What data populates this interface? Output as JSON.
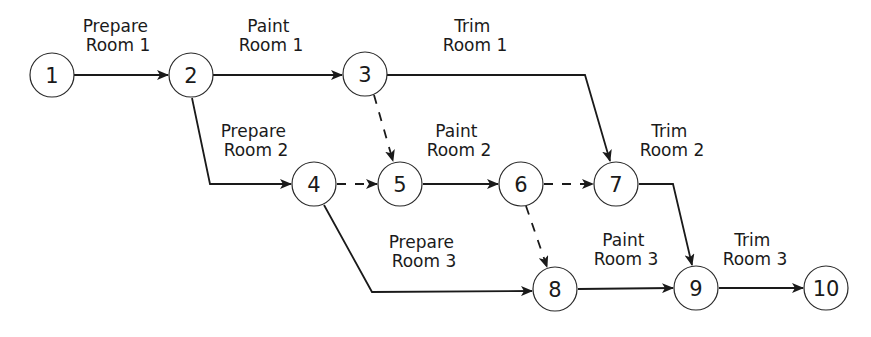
{
  "diagram": {
    "type": "activity-on-arrow network",
    "nodes": [
      {
        "id": "1",
        "label": "1",
        "x": 52,
        "y": 75
      },
      {
        "id": "2",
        "label": "2",
        "x": 191,
        "y": 75
      },
      {
        "id": "3",
        "label": "3",
        "x": 365,
        "y": 74
      },
      {
        "id": "4",
        "label": "4",
        "x": 314,
        "y": 184
      },
      {
        "id": "5",
        "label": "5",
        "x": 400,
        "y": 184
      },
      {
        "id": "6",
        "label": "6",
        "x": 521,
        "y": 184
      },
      {
        "id": "7",
        "label": "7",
        "x": 616,
        "y": 184
      },
      {
        "id": "8",
        "label": "8",
        "x": 555,
        "y": 289
      },
      {
        "id": "9",
        "label": "9",
        "x": 696,
        "y": 288
      },
      {
        "id": "10",
        "label": "10",
        "x": 826,
        "y": 288
      }
    ],
    "edges": [
      {
        "from": "1",
        "to": "2",
        "style": "solid",
        "label_line1": "Prepare",
        "label_line2": "Room 1"
      },
      {
        "from": "2",
        "to": "3",
        "style": "solid",
        "label_line1": "Paint",
        "label_line2": "Room 1"
      },
      {
        "from": "3",
        "to": "7",
        "style": "solid",
        "label_line1": "Trim",
        "label_line2": "Room 1"
      },
      {
        "from": "2",
        "to": "4",
        "style": "solid",
        "label_line1": "Prepare",
        "label_line2": "Room 2"
      },
      {
        "from": "3",
        "to": "5",
        "style": "dashed",
        "label_line1": "",
        "label_line2": ""
      },
      {
        "from": "4",
        "to": "5",
        "style": "dashed",
        "label_line1": "",
        "label_line2": ""
      },
      {
        "from": "5",
        "to": "6",
        "style": "solid",
        "label_line1": "Paint",
        "label_line2": "Room 2"
      },
      {
        "from": "6",
        "to": "7",
        "style": "dashed",
        "label_line1": "",
        "label_line2": ""
      },
      {
        "from": "7",
        "to": "9",
        "style": "solid",
        "label_line1": "Trim",
        "label_line2": "Room 2"
      },
      {
        "from": "4",
        "to": "8",
        "style": "solid",
        "label_line1": "Prepare",
        "label_line2": "Room 3"
      },
      {
        "from": "6",
        "to": "8",
        "style": "dashed",
        "label_line1": "",
        "label_line2": ""
      },
      {
        "from": "8",
        "to": "9",
        "style": "solid",
        "label_line1": "Paint",
        "label_line2": "Room 3"
      },
      {
        "from": "9",
        "to": "10",
        "style": "solid",
        "label_line1": "Trim",
        "label_line2": "Room 3"
      }
    ]
  },
  "colors": {
    "line": "#1a1a1a",
    "node_fill": "#ffffff",
    "background": "#ffffff"
  }
}
